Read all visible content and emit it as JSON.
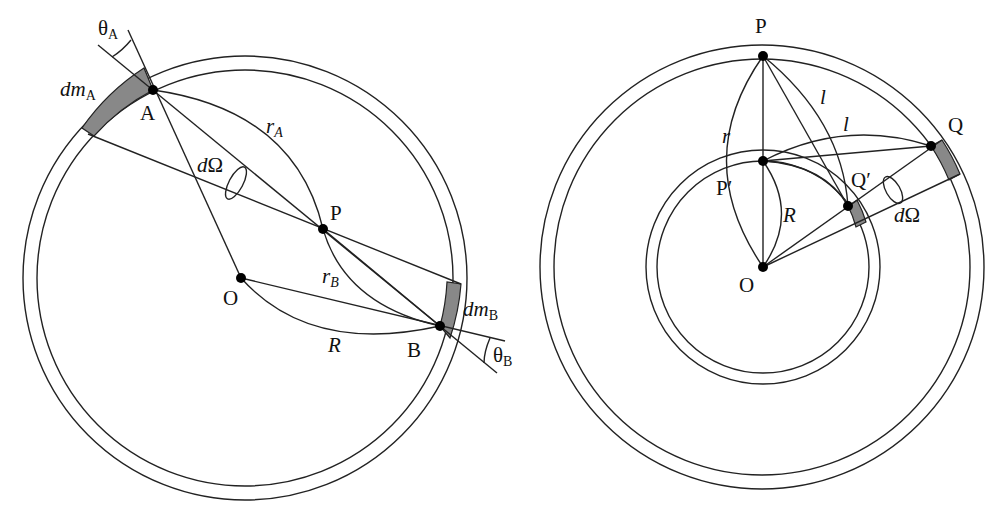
{
  "left_diagram": {
    "labels": {
      "theta_A": {
        "main": "θ",
        "sub": "A"
      },
      "dm_A": {
        "main": "dm",
        "sub": "A"
      },
      "A": "A",
      "r_A": {
        "main": "r",
        "sub": "A"
      },
      "dOmega": {
        "d": "d",
        "omega": "Ω"
      },
      "P": "P",
      "O": "O",
      "r_B": {
        "main": "r",
        "sub": "B"
      },
      "dm_B": {
        "main": "dm",
        "sub": "B"
      },
      "R": "R",
      "B": "B",
      "theta_B": {
        "main": "θ",
        "sub": "B"
      }
    },
    "circle_center": [
      245,
      278
    ],
    "outer_radius": 222,
    "inner_radius": 208
  },
  "right_diagram": {
    "labels": {
      "P": "P",
      "l_upper": "l",
      "l_lower": "l",
      "Q": "Q",
      "r": "r",
      "P_prime": "P′",
      "Q_prime": "Q′",
      "R": "R",
      "dOmega": {
        "d": "d",
        "omega": "Ω"
      },
      "O": "O"
    },
    "circle_center": [
      762,
      267
    ],
    "outer_radius": 222,
    "inner_radius": 208,
    "mid_outer_radius": 117,
    "mid_inner_radius": 106
  },
  "colors": {
    "line": "#222222",
    "shade": "#888888",
    "background": "#ffffff"
  }
}
